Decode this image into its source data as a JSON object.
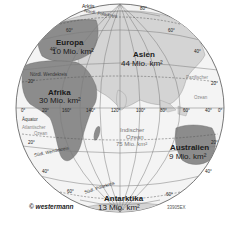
{
  "map": {
    "type": "orthographic-globe-hemisphere",
    "colors": {
      "ocean": "#f4f4f4",
      "land_highlight": "#8c8c8c",
      "land_other": "#d4d4d4",
      "grid": "#7a7a7a",
      "outline": "#555555"
    },
    "continents": [
      {
        "name": "Europa",
        "area": "10 Mio. km²"
      },
      {
        "name": "Asien",
        "area": "44 Mio. km²"
      },
      {
        "name": "Afrika",
        "area": "30 Mio. km²"
      },
      {
        "name": "Australien",
        "area": "9 Mio. km²"
      },
      {
        "name": "Antarktika",
        "area": "13 Mio. km²"
      }
    ],
    "oceans": [
      {
        "name": "Indischer",
        "name2": "Ozean",
        "area": "75 Mio. km²"
      },
      {
        "name": "Atlantischer",
        "name2": "Ozean"
      },
      {
        "name": "Pazifischer",
        "name2": "Ozean"
      }
    ],
    "lines": {
      "arctic": "Arktis",
      "polarkreis_n": "Nördl. Polarkreis",
      "wendekreis_n": "Nördl. Wendekreis",
      "equator": "Äquator",
      "wendekreis_s": "Südl. Wendekreis",
      "polarkreis_s": "Südl. Polarkreis"
    },
    "latitude_labels": [
      "80°",
      "60°",
      "40°",
      "20°",
      "20°",
      "40°",
      "60°",
      "60°",
      "40°",
      "20°",
      "20°",
      "40°",
      "60°"
    ],
    "longitude_labels": [
      "0°",
      "20°",
      "160°",
      "140°",
      "120°",
      "100°",
      "80°",
      "60°",
      "40°",
      "0°"
    ],
    "credit": "© westermann",
    "code": "33905EX"
  }
}
